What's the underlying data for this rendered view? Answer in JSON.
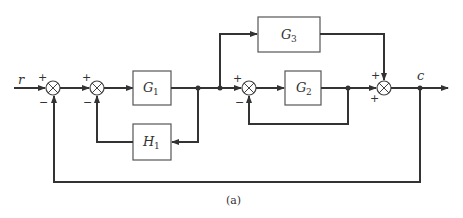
{
  "diagram": {
    "type": "control-system block diagram",
    "caption": "(a)",
    "input_label": "r",
    "output_label": "c",
    "blocks": [
      {
        "id": "G1",
        "label": "G",
        "subscript": "1"
      },
      {
        "id": "G2",
        "label": "G",
        "subscript": "2"
      },
      {
        "id": "G3",
        "label": "G",
        "subscript": "3"
      },
      {
        "id": "H1",
        "label": "H",
        "subscript": "1"
      }
    ],
    "summing_junctions": [
      {
        "id": "S1",
        "signs": {
          "top": "+",
          "bottom": "−"
        }
      },
      {
        "id": "S2",
        "signs": {
          "top": "+",
          "bottom": "−"
        }
      },
      {
        "id": "S3",
        "signs": {
          "top": "+",
          "bottom": "−"
        }
      },
      {
        "id": "S4",
        "signs": {
          "top": "+",
          "bottom": "+"
        }
      }
    ],
    "connections": [
      "r → S1(+)",
      "S1 → S2(+)",
      "S2 → G1",
      "G1 output → H1 → S2(−)",
      "G1 output → G3 → S4(+)",
      "G1 output → S3(+)",
      "S3 → G2",
      "G2 output → S3(−) (unity feedback)",
      "G2 output → S4(+)",
      "S4 → c",
      "c → S1(−) (unity feedback)"
    ]
  }
}
